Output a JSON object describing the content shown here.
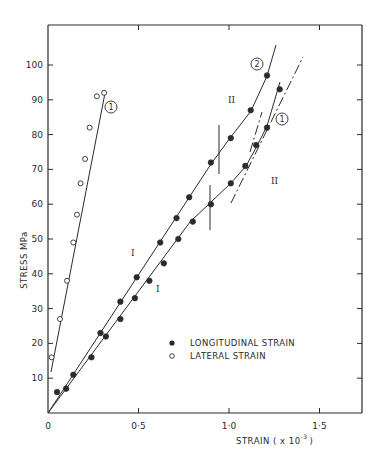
{
  "chart_data": {
    "type": "scatter",
    "title": "",
    "xlabel": "STRAIN ( x 10⁻³ )",
    "xlabel_main": "STRAIN ( x 10",
    "xlabel_exp": "-3",
    "xlabel_close": ")",
    "ylabel": "STRESS MPa",
    "xlim": [
      0,
      1.72
    ],
    "ylim": [
      0,
      111
    ],
    "x_ticks": [
      0,
      0.5,
      1.0,
      1.5
    ],
    "x_tick_labels": [
      "0",
      "0·5",
      "1·0",
      "1·5"
    ],
    "y_ticks": [
      10,
      20,
      30,
      40,
      50,
      60,
      70,
      80,
      90,
      100
    ],
    "y_tick_labels": [
      "10",
      "20",
      "30",
      "40",
      "50",
      "60",
      "70",
      "80",
      "90",
      "100"
    ],
    "grid": false,
    "legend_position": "lower-right",
    "legend": [
      {
        "marker": "filled-circle",
        "label": "LONGITUDINAL STRAIN"
      },
      {
        "marker": "open-circle",
        "label": "LATERAL STRAIN"
      }
    ],
    "series": [
      {
        "name": "Lateral strain ①",
        "marker": "open-circle",
        "curve_label": "1",
        "x": [
          0.02,
          0.066,
          0.105,
          0.14,
          0.16,
          0.18,
          0.205,
          0.23,
          0.27,
          0.31
        ],
        "y": [
          16,
          27,
          38,
          49,
          57,
          66,
          73,
          82,
          91,
          92
        ]
      },
      {
        "name": "Longitudinal strain ②",
        "marker": "filled-circle",
        "curve_label": "2",
        "x": [
          0.05,
          0.14,
          0.29,
          0.4,
          0.49,
          0.62,
          0.71,
          0.78,
          0.9,
          1.01,
          1.12,
          1.21
        ],
        "y": [
          6,
          11,
          23,
          32,
          39,
          49,
          56,
          62,
          72,
          79,
          87,
          97
        ]
      },
      {
        "name": "Longitudinal strain ①",
        "marker": "filled-circle",
        "curve_label": "1",
        "x": [
          0.1,
          0.24,
          0.32,
          0.4,
          0.48,
          0.56,
          0.64,
          0.72,
          0.8,
          0.9,
          1.01,
          1.09,
          1.15,
          1.21,
          1.28
        ],
        "y": [
          7,
          16,
          22,
          27,
          33,
          38,
          43,
          50,
          55,
          60,
          66,
          71,
          77,
          82,
          93
        ]
      }
    ],
    "annotations": [
      {
        "text": "I",
        "note": "Stage I region, curve 2"
      },
      {
        "text": "I",
        "note": "Stage I region, curve 1"
      },
      {
        "text": "II",
        "note": "Stage II region, curve 2"
      },
      {
        "text": "II",
        "note": "Stage II region, curve 1"
      },
      {
        "text": "1",
        "note": "circled label on lateral curve"
      },
      {
        "text": "2",
        "note": "circled label on longitudinal curve 2"
      },
      {
        "text": "1",
        "note": "circled label on longitudinal curve 1"
      }
    ]
  },
  "labels": {
    "roman_I": "I",
    "roman_II": "II",
    "circ_1": "1",
    "circ_2": "2",
    "origin": "0"
  },
  "colors": {
    "ink": "#2b2b2b",
    "background": "#ffffff"
  }
}
